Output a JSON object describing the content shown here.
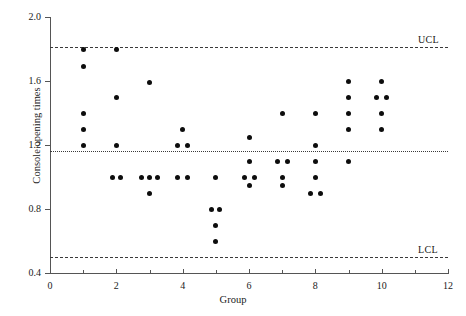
{
  "chart_data": {
    "type": "scatter",
    "title": "",
    "subtitle": "",
    "xlabel": "Group",
    "ylabel": "Console opening times",
    "xlim": [
      0,
      12
    ],
    "ylim": [
      0.4,
      2.0
    ],
    "x_ticks": [
      0,
      2,
      4,
      6,
      8,
      10,
      12
    ],
    "x_tick_labels": [
      "0",
      "2",
      "4",
      "6",
      "8",
      "10",
      "12"
    ],
    "x_minor_ticks": [
      1,
      3,
      5,
      7,
      9,
      11
    ],
    "y_ticks": [
      0.4,
      0.8,
      1.2,
      1.6,
      2.0
    ],
    "y_tick_labels": [
      "0.4",
      "0.8",
      "1.2",
      "1.6",
      "2.0"
    ],
    "grid": false,
    "legend": "none",
    "marker": "filled-circle",
    "marker_color": "#0d0d0d",
    "control_limits": [
      {
        "name": "UCL",
        "label": "UCL",
        "value": 1.81,
        "style": "dashed"
      },
      {
        "name": "CL",
        "label": "",
        "value": 1.165,
        "style": "dotted"
      },
      {
        "name": "LCL",
        "label": "LCL",
        "value": 0.5,
        "style": "dashed"
      }
    ],
    "series": [
      {
        "name": "Console opening times",
        "group_label": "Group",
        "groups": [
          {
            "x": 1,
            "values": [
              1.8,
              1.69,
              1.4,
              1.3,
              1.2
            ],
            "offsets": [
              0,
              0,
              0,
              0,
              0
            ]
          },
          {
            "x": 2,
            "values": [
              1.8,
              1.5,
              1.2,
              1.0,
              1.0
            ],
            "offsets": [
              0,
              0,
              0,
              -4,
              4
            ]
          },
          {
            "x": 3,
            "values": [
              1.59,
              1.0,
              1.0,
              1.0,
              0.9
            ],
            "offsets": [
              0,
              -8,
              0,
              8,
              0
            ]
          },
          {
            "x": 4,
            "values": [
              1.3,
              1.2,
              1.2,
              1.0,
              1.0
            ],
            "offsets": [
              0,
              -5,
              5,
              -5,
              5
            ]
          },
          {
            "x": 5,
            "values": [
              1.0,
              0.8,
              0.8,
              0.7,
              0.6
            ],
            "offsets": [
              0,
              -4,
              4,
              0,
              0
            ]
          },
          {
            "x": 6,
            "values": [
              1.25,
              1.1,
              1.0,
              1.0,
              0.95
            ],
            "offsets": [
              0,
              0,
              -5,
              5,
              0
            ]
          },
          {
            "x": 7,
            "values": [
              1.4,
              1.1,
              1.1,
              1.0,
              0.95
            ],
            "offsets": [
              0,
              -5,
              5,
              0,
              0
            ]
          },
          {
            "x": 8,
            "values": [
              1.4,
              1.2,
              1.1,
              1.0,
              0.9,
              0.9
            ],
            "offsets": [
              0,
              0,
              0,
              0,
              -5,
              5
            ]
          },
          {
            "x": 9,
            "values": [
              1.6,
              1.5,
              1.4,
              1.3,
              1.1
            ],
            "offsets": [
              0,
              0,
              0,
              0,
              0
            ]
          },
          {
            "x": 10,
            "values": [
              1.6,
              1.5,
              1.5,
              1.4,
              1.3
            ],
            "offsets": [
              0,
              -5,
              5,
              0,
              0
            ]
          }
        ]
      }
    ]
  }
}
